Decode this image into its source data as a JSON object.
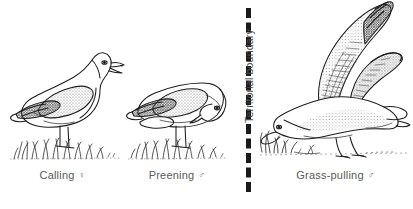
{
  "figure": {
    "background_color": "#ffffff",
    "ink_color": "#222222",
    "label_color": "#5a5a5a"
  },
  "boundary": {
    "label": "Territorial boundary",
    "style": "dashed-vertical-line",
    "color": "#1a1a1a"
  },
  "panels": [
    {
      "id": "calling",
      "caption": "Calling",
      "sex_symbol": "♀",
      "sex_name": "female",
      "subject": "herring-gull",
      "posture": "standing upright with open beak, head raised, calling"
    },
    {
      "id": "preening",
      "caption": "Preening",
      "sex_symbol": "♂",
      "sex_name": "male",
      "subject": "herring-gull",
      "posture": "standing with head turned down and back, bill tucked to breast"
    },
    {
      "id": "grass-pulling",
      "caption": "Grass-pulling",
      "sex_symbol": "♂",
      "sex_name": "male",
      "subject": "herring-gull",
      "posture": "wings raised high, head lowered to ground pulling grass"
    }
  ]
}
